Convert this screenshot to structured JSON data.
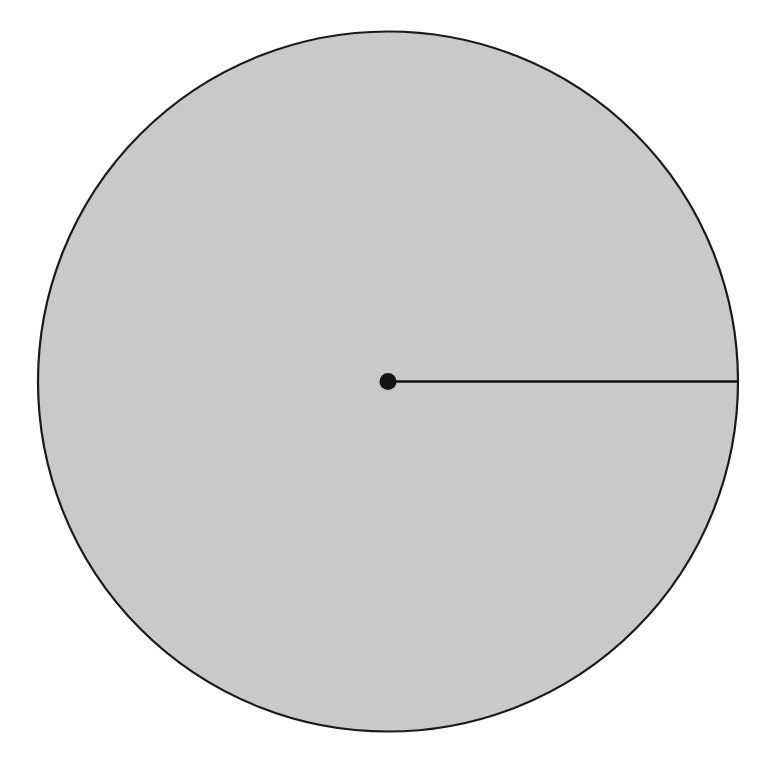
{
  "canvas": {
    "width": 772,
    "height": 769,
    "background_color": "#ffffff"
  },
  "figure": {
    "kind": "circle-with-radius-diagram",
    "labels": [],
    "annotations": []
  },
  "chart_data": {
    "type": "scatter",
    "title": "",
    "subtitle": "",
    "xlabel": "",
    "ylabel": "",
    "grid": false,
    "legend_position": "none",
    "xlim": [
      0,
      772
    ],
    "ylim": [
      769,
      0
    ],
    "shapes": [
      {
        "name": "circle",
        "type": "circle",
        "center_x": 388,
        "center_y": 381.5,
        "radius": 350,
        "fill": "#c9c9c9",
        "stroke": "#1a1a1a",
        "stroke_width": 2.2
      },
      {
        "name": "radius-segment",
        "type": "line",
        "x1": 388,
        "y1": 381.5,
        "x2": 738,
        "y2": 381.5,
        "stroke": "#111111",
        "stroke_width": 2.6,
        "length": 350,
        "angle_degrees": 0
      },
      {
        "name": "center-point",
        "type": "dot",
        "center_x": 388,
        "center_y": 381.5,
        "radius": 8.5,
        "fill": "#141414"
      }
    ]
  },
  "colors": {
    "background": "#ffffff",
    "circle_fill": "#c9c9c9",
    "circle_stroke": "#1a1a1a",
    "radius_line": "#111111",
    "center_dot": "#141414"
  }
}
